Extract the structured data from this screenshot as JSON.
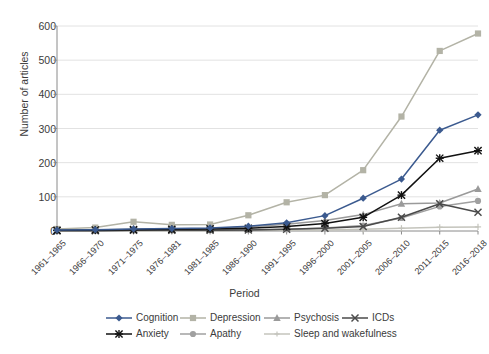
{
  "chart_data": {
    "type": "line",
    "title": "",
    "xlabel": "Period",
    "ylabel": "Number of articles",
    "ylim": [
      0,
      600
    ],
    "ytick_step": 100,
    "grid": true,
    "legend_position": "bottom",
    "categories": [
      "1961–1965",
      "1966–1970",
      "1971–1975",
      "1976–1981",
      "1981–1985",
      "1986–1990",
      "1991–1995",
      "1996–2000",
      "2001–2005",
      "2006–2010",
      "2011–2015",
      "2016–2018"
    ],
    "yticks": [
      "0",
      "100",
      "200",
      "300",
      "400",
      "500",
      "600"
    ],
    "series": [
      {
        "name": "Cognition",
        "color": "#3b5a8f",
        "marker": "diamond",
        "values": [
          3,
          4,
          6,
          7,
          9,
          14,
          24,
          45,
          96,
          152,
          295,
          340
        ]
      },
      {
        "name": "Depression",
        "color": "#b3b3a6",
        "marker": "square",
        "values": [
          6,
          10,
          27,
          18,
          19,
          46,
          84,
          105,
          178,
          335,
          527,
          578
        ]
      },
      {
        "name": "Psychosis",
        "color": "#9a9a9a",
        "marker": "triangle",
        "values": [
          2,
          3,
          5,
          6,
          7,
          12,
          20,
          31,
          48,
          80,
          82,
          123
        ]
      },
      {
        "name": "ICDs",
        "color": "#4a4a4a",
        "marker": "x",
        "values": [
          1,
          1,
          2,
          2,
          2,
          3,
          5,
          8,
          13,
          40,
          80,
          55
        ]
      },
      {
        "name": "Anxiety",
        "color": "#111111",
        "marker": "star",
        "values": [
          2,
          3,
          4,
          5,
          6,
          8,
          13,
          22,
          40,
          105,
          213,
          235
        ]
      },
      {
        "name": "Apathy",
        "color": "#a0a0a0",
        "marker": "circle",
        "values": [
          1,
          1,
          2,
          2,
          2,
          3,
          5,
          9,
          16,
          38,
          72,
          88
        ]
      },
      {
        "name": "Sleep and wakefulness",
        "color": "#c4c4bc",
        "marker": "plus",
        "values": [
          0,
          1,
          1,
          1,
          1,
          2,
          2,
          3,
          5,
          8,
          11,
          12
        ]
      }
    ]
  },
  "axis": {
    "ylabel": "Number of articles",
    "xlabel": "Period"
  }
}
